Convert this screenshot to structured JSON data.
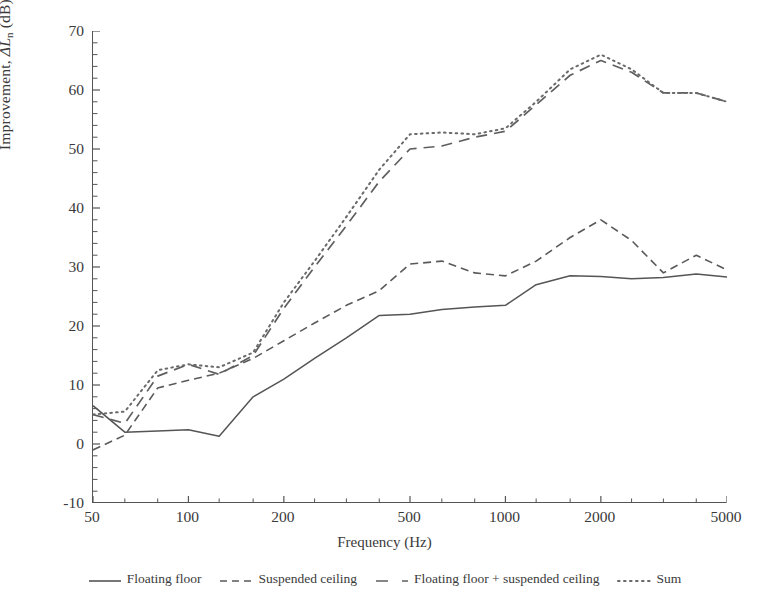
{
  "chart_data": {
    "type": "line",
    "title": "",
    "xlabel": "Frequency (Hz)",
    "ylabel": "Improvement, ΔLn (dB)",
    "xscale": "log",
    "xlim": [
      50,
      5000
    ],
    "ylim": [
      -10,
      70
    ],
    "ytick_step": 10,
    "yminor_step": 2,
    "grid": false,
    "legend_position": "below",
    "xticks": [
      50,
      100,
      200,
      500,
      1000,
      2000,
      5000
    ],
    "xtick_labels": [
      "50",
      "100",
      "200",
      "500",
      "1000",
      "2000",
      "5000"
    ],
    "yticks": [
      -10,
      0,
      10,
      20,
      30,
      40,
      50,
      60,
      70
    ],
    "ytick_labels": [
      "-10",
      "0",
      "10",
      "20",
      "30",
      "40",
      "50",
      "60",
      "70"
    ],
    "x": [
      50,
      63,
      80,
      100,
      125,
      160,
      200,
      250,
      315,
      400,
      500,
      630,
      800,
      1000,
      1250,
      1600,
      2000,
      2500,
      3150,
      4000,
      5000
    ],
    "series": [
      {
        "name": "Floating floor",
        "style": "solid",
        "color": "#555555",
        "values": [
          6.5,
          2.0,
          2.2,
          2.4,
          1.3,
          8.0,
          11.0,
          14.5,
          18.0,
          21.8,
          22.0,
          22.8,
          23.2,
          23.5,
          27.0,
          28.5,
          28.4,
          28.0,
          28.2,
          28.8,
          28.3
        ]
      },
      {
        "name": "Suspended ceiling",
        "style": "dashed",
        "color": "#5a5a5a",
        "values": [
          -1.0,
          1.5,
          9.5,
          10.8,
          12.0,
          14.5,
          17.5,
          20.5,
          23.5,
          26.0,
          30.5,
          31.0,
          29.0,
          28.5,
          31.0,
          35.0,
          38.0,
          34.5,
          29.0,
          32.0,
          29.5
        ]
      },
      {
        "name": "Floating floor + suspended ceiling",
        "style": "longdash",
        "color": "#5f5f5f",
        "values": [
          5.0,
          3.5,
          11.5,
          13.5,
          11.8,
          15.0,
          23.0,
          30.0,
          37.0,
          44.5,
          50.0,
          50.5,
          52.0,
          53.0,
          57.5,
          62.5,
          65.0,
          63.0,
          59.5,
          59.5,
          58.0
        ]
      },
      {
        "name": "Sum",
        "style": "dotted",
        "color": "#6a6a6a",
        "values": [
          5.0,
          5.5,
          12.5,
          13.5,
          13.0,
          15.5,
          24.0,
          31.0,
          38.5,
          46.5,
          52.5,
          52.8,
          52.5,
          53.5,
          58.0,
          63.5,
          66.0,
          63.5,
          59.5,
          59.5,
          58.0
        ]
      }
    ]
  },
  "axes": {
    "y_title_prefix": "Improvement, ",
    "y_title_symbol": "ΔL",
    "y_title_sub": "n",
    "y_title_suffix": " (dB)",
    "x_title": "Frequency (Hz)"
  },
  "legend": {
    "items": [
      {
        "label": "Floating floor",
        "style": "solid"
      },
      {
        "label": "Suspended ceiling",
        "style": "dashed"
      },
      {
        "label": "Floating floor + suspended ceiling",
        "style": "longdash"
      },
      {
        "label": "Sum",
        "style": "dotted"
      }
    ]
  },
  "colors": {
    "axis": "#555555",
    "text": "#3a3a3a",
    "background": "#ffffff"
  }
}
